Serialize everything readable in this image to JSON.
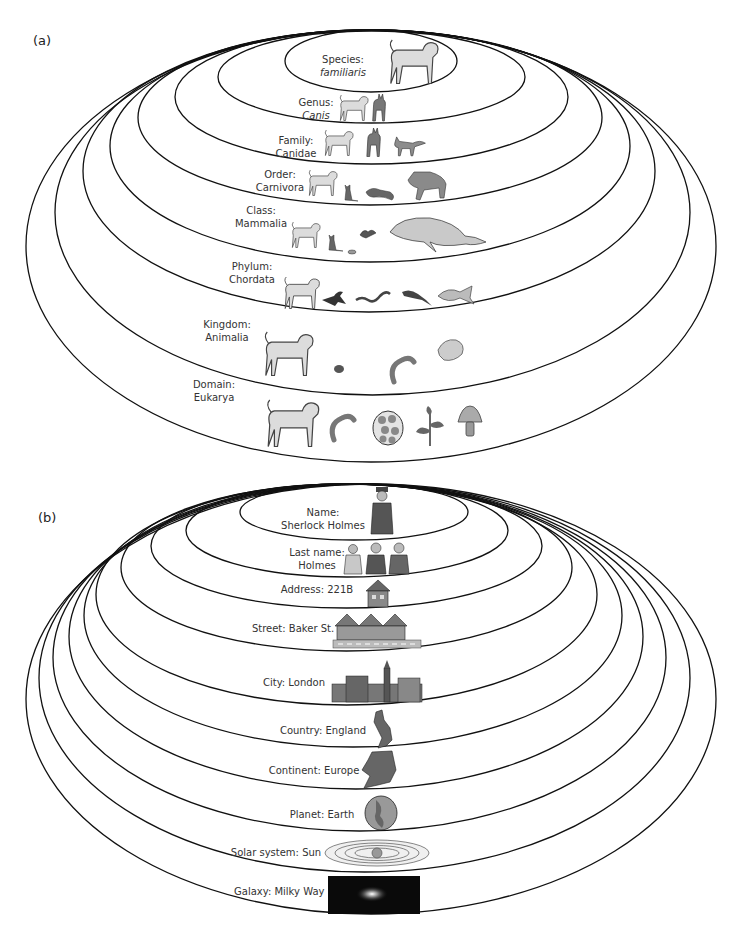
{
  "panel_a": {
    "label": "(a)",
    "levels": [
      {
        "rank": "Species:",
        "name": "familiaris",
        "italic": true,
        "icons": [
          "dog-icon"
        ]
      },
      {
        "rank": "Genus:",
        "name": "Canis",
        "italic": true,
        "icons": [
          "dog-icon",
          "wolf-icon"
        ]
      },
      {
        "rank": "Family:",
        "name": "Canidae",
        "italic": false,
        "icons": [
          "dog-icon",
          "wolf-icon",
          "fox-icon"
        ]
      },
      {
        "rank": "Order:",
        "name": "Carnivora",
        "italic": false,
        "icons": [
          "dog-icon",
          "cat-icon",
          "weasel-icon",
          "hyena-icon"
        ]
      },
      {
        "rank": "Class:",
        "name": "Mammalia",
        "italic": false,
        "icons": [
          "dog-icon",
          "cat-icon",
          "mouse-icon",
          "bat-icon",
          "whale-icon"
        ]
      },
      {
        "rank": "Phylum:",
        "name": "Chordata",
        "italic": false,
        "icons": [
          "dog-icon",
          "bird-icon",
          "snake-icon",
          "lizard-icon",
          "fish-icon"
        ]
      },
      {
        "rank": "Kingdom:",
        "name": "Animalia",
        "italic": false,
        "icons": [
          "dog-icon",
          "beetle-icon",
          "worm-icon",
          "shell-icon"
        ]
      },
      {
        "rank": "Domain:",
        "name": "Eukarya",
        "italic": false,
        "icons": [
          "dog-icon",
          "worm-icon",
          "cell-icon",
          "plant-icon",
          "mushroom-icon"
        ]
      }
    ]
  },
  "panel_b": {
    "label": "(b)",
    "levels": [
      {
        "text": "Name:",
        "text2": "Sherlock Holmes",
        "icons": [
          "detective-icon"
        ]
      },
      {
        "text": "Last name:",
        "text2": "Holmes",
        "icons": [
          "family-icon"
        ]
      },
      {
        "text": "Address: 221B",
        "text2": "",
        "icons": [
          "house-icon"
        ]
      },
      {
        "text": "Street: Baker St.",
        "text2": "",
        "icons": [
          "street-houses-icon"
        ]
      },
      {
        "text": "City: London",
        "text2": "",
        "icons": [
          "city-skyline-icon"
        ]
      },
      {
        "text": "Country: England",
        "text2": "",
        "icons": [
          "uk-map-icon"
        ]
      },
      {
        "text": "Continent: Europe",
        "text2": "",
        "icons": [
          "europe-map-icon"
        ]
      },
      {
        "text": "Planet: Earth",
        "text2": "",
        "icons": [
          "earth-globe-icon"
        ]
      },
      {
        "text": "Solar system: Sun",
        "text2": "",
        "icons": [
          "solar-system-icon"
        ]
      },
      {
        "text": "Galaxy: Milky Way",
        "text2": "",
        "icons": [
          "galaxy-icon"
        ]
      }
    ]
  },
  "colors": {
    "stroke": "#111111",
    "icon_light": "#d9d9d9",
    "icon_mid": "#8a8a8a",
    "icon_dark": "#555555",
    "galaxy_bg": "#0a0a0a"
  }
}
